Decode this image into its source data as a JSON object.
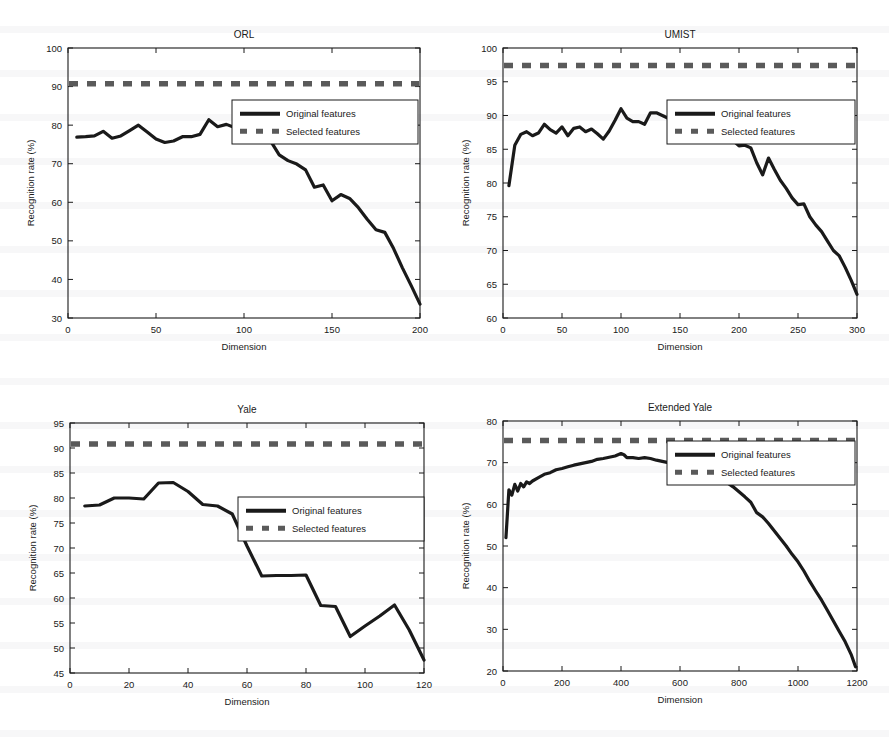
{
  "figure": {
    "axis_label_x": "Dimension",
    "axis_label_y": "Recognition rate (%)",
    "legend": {
      "original": "Original features",
      "selected": "Selected features"
    },
    "colors": {
      "curve": "#1a1a1a",
      "dashed": "#5a5a5a",
      "axis": "#1a1a1a",
      "background": "#ffffff"
    }
  },
  "chart_data": [
    {
      "type": "line",
      "title": "ORL",
      "xlabel": "Dimension",
      "ylabel": "Recognition rate (%)",
      "xlim": [
        0,
        200
      ],
      "ylim": [
        30,
        100
      ],
      "xticks": [
        0,
        50,
        100,
        150,
        200
      ],
      "yticks": [
        30,
        40,
        50,
        60,
        70,
        80,
        90,
        100
      ],
      "grid": false,
      "legend_position": "upper right",
      "series": [
        {
          "name": "Original features",
          "style": "solid",
          "x": [
            5,
            10,
            15,
            20,
            25,
            30,
            35,
            40,
            45,
            50,
            55,
            60,
            65,
            70,
            75,
            80,
            85,
            90,
            95,
            100,
            105,
            110,
            115,
            120,
            125,
            130,
            135,
            140,
            145,
            150,
            155,
            160,
            165,
            170,
            175,
            180,
            185,
            190,
            195,
            200
          ],
          "values": [
            76.9,
            77.0,
            77.2,
            78.4,
            76.6,
            77.2,
            78.6,
            80.0,
            78.2,
            76.4,
            75.5,
            75.9,
            77.0,
            77.0,
            77.6,
            81.4,
            79.6,
            80.2,
            79.3,
            78.0,
            77.2,
            79.0,
            76.0,
            72.3,
            70.8,
            69.9,
            68.4,
            63.9,
            64.5,
            60.4,
            62.0,
            61.0,
            58.6,
            55.6,
            52.9,
            52.2,
            48.0,
            43.0,
            38.4,
            33.6
          ]
        },
        {
          "name": "Selected features",
          "style": "dashed",
          "constant": 90.7
        }
      ]
    },
    {
      "type": "line",
      "title": "UMIST",
      "xlabel": "Dimension",
      "ylabel": "Recognition rate (%)",
      "xlim": [
        0,
        300
      ],
      "ylim": [
        60,
        100
      ],
      "xticks": [
        0,
        50,
        100,
        150,
        200,
        250,
        300
      ],
      "yticks": [
        60,
        65,
        70,
        75,
        80,
        85,
        90,
        95,
        100
      ],
      "grid": false,
      "legend_position": "upper right",
      "series": [
        {
          "name": "Original features",
          "style": "solid",
          "x": [
            5,
            10,
            15,
            20,
            25,
            30,
            35,
            40,
            45,
            50,
            55,
            60,
            65,
            70,
            75,
            80,
            85,
            90,
            95,
            100,
            105,
            110,
            115,
            120,
            125,
            130,
            135,
            140,
            145,
            150,
            155,
            160,
            165,
            170,
            175,
            180,
            185,
            190,
            195,
            200,
            205,
            210,
            215,
            220,
            225,
            230,
            235,
            240,
            245,
            250,
            255,
            260,
            265,
            270,
            275,
            280,
            285,
            290,
            295,
            300
          ],
          "values": [
            79.6,
            85.6,
            87.2,
            87.6,
            87.0,
            87.4,
            88.7,
            87.9,
            87.4,
            88.3,
            87.0,
            88.1,
            88.3,
            87.6,
            88.0,
            87.3,
            86.5,
            87.7,
            89.3,
            91.0,
            89.6,
            89.1,
            89.1,
            88.7,
            90.4,
            90.4,
            90.0,
            89.6,
            89.0,
            88.5,
            88.7,
            89.5,
            88.8,
            89.2,
            88.5,
            88.0,
            87.5,
            87.0,
            86.3,
            85.5,
            85.6,
            85.2,
            83.0,
            81.2,
            83.7,
            82.0,
            80.4,
            79.2,
            77.8,
            76.8,
            76.9,
            75.0,
            73.8,
            72.8,
            71.4,
            70.0,
            69.2,
            67.5,
            65.6,
            63.5
          ]
        },
        {
          "name": "Selected features",
          "style": "dashed",
          "constant": 97.4
        }
      ]
    },
    {
      "type": "line",
      "title": "Yale",
      "xlabel": "Dimension",
      "ylabel": "Recognition rate (%)",
      "xlim": [
        0,
        120
      ],
      "ylim": [
        45,
        95
      ],
      "xticks": [
        0,
        20,
        40,
        60,
        80,
        100,
        120
      ],
      "yticks": [
        45,
        50,
        55,
        60,
        65,
        70,
        75,
        80,
        85,
        90,
        95
      ],
      "grid": false,
      "legend_position": "center right",
      "series": [
        {
          "name": "Original features",
          "style": "solid",
          "x": [
            5,
            10,
            15,
            20,
            25,
            30,
            35,
            40,
            45,
            50,
            55,
            60,
            65,
            70,
            75,
            80,
            85,
            90,
            95,
            100,
            105,
            110,
            115,
            120
          ],
          "values": [
            78.4,
            78.6,
            80.0,
            80.0,
            79.8,
            83.0,
            83.1,
            81.3,
            78.7,
            78.4,
            76.8,
            70.4,
            64.4,
            64.5,
            64.5,
            64.6,
            58.5,
            58.3,
            52.3,
            54.4,
            56.4,
            58.6,
            53.6,
            47.6
          ]
        },
        {
          "name": "Selected features",
          "style": "dashed",
          "constant": 90.8
        }
      ]
    },
    {
      "type": "line",
      "title": "Extended Yale",
      "xlabel": "Dimension",
      "ylabel": "Recognition rate (%)",
      "xlim": [
        0,
        1200
      ],
      "ylim": [
        20,
        80
      ],
      "xticks": [
        0,
        200,
        400,
        600,
        800,
        1000,
        1200
      ],
      "yticks": [
        20,
        30,
        40,
        50,
        60,
        70,
        80
      ],
      "grid": false,
      "legend_position": "upper right",
      "series": [
        {
          "name": "Original features",
          "style": "solid",
          "x": [
            10,
            20,
            30,
            40,
            50,
            60,
            70,
            80,
            90,
            100,
            120,
            140,
            160,
            180,
            200,
            220,
            240,
            260,
            280,
            300,
            320,
            340,
            360,
            380,
            400,
            410,
            420,
            440,
            460,
            480,
            500,
            520,
            540,
            560,
            580,
            600,
            620,
            640,
            660,
            680,
            700,
            720,
            740,
            760,
            780,
            800,
            820,
            840,
            860,
            880,
            900,
            920,
            940,
            960,
            980,
            1000,
            1020,
            1040,
            1060,
            1080,
            1100,
            1120,
            1140,
            1160,
            1180,
            1195
          ],
          "values": [
            52.0,
            63.5,
            62.2,
            64.8,
            63.2,
            65.0,
            64.2,
            65.4,
            65.0,
            65.6,
            66.4,
            67.2,
            67.6,
            68.3,
            68.6,
            69.0,
            69.4,
            69.7,
            70.0,
            70.3,
            70.8,
            71.0,
            71.3,
            71.6,
            72.2,
            71.9,
            71.2,
            71.2,
            71.0,
            71.2,
            71.0,
            70.6,
            70.3,
            70.0,
            69.6,
            69.2,
            69.4,
            68.8,
            68.6,
            68.7,
            68.2,
            67.2,
            66.2,
            65.2,
            64.2,
            63.0,
            61.8,
            60.5,
            58.0,
            57.0,
            55.4,
            53.6,
            51.8,
            50.0,
            48.0,
            46.2,
            44.0,
            41.5,
            39.2,
            37.0,
            34.5,
            32.0,
            29.5,
            27.0,
            24.0,
            21.0
          ]
        },
        {
          "name": "Selected features",
          "style": "dashed",
          "constant": 75.3
        }
      ]
    }
  ]
}
